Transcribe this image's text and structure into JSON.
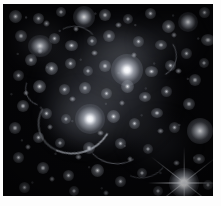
{
  "image": {
    "kind": "astronomical-photograph",
    "subject": "galaxy cluster with gravitational lensing arcs",
    "palette": "grayscale",
    "background_color": "#050507",
    "frame_color": "#fdfdfd",
    "star_color": "#ffffff",
    "halo_color": "#8d93a0",
    "arc_color": "#c9ced8",
    "width_px": 221,
    "height_px": 206,
    "frame": {
      "top_px": 4,
      "left_px": 3,
      "right_px": 8,
      "bottom_px": 10
    },
    "field": {
      "x": 3,
      "y": 4,
      "width": 210,
      "height": 192
    }
  },
  "objects": {
    "intracluster_light": [
      {
        "name": "central-halo",
        "x": 104,
        "y": 92,
        "w": 130,
        "h": 120,
        "opacity": 0.3
      },
      {
        "name": "north-halo",
        "x": 120,
        "y": 52,
        "w": 78,
        "h": 66,
        "opacity": 0.26
      },
      {
        "name": "southwest-halo",
        "x": 78,
        "y": 118,
        "w": 70,
        "h": 58,
        "opacity": 0.24
      },
      {
        "name": "west-halo",
        "x": 42,
        "y": 42,
        "w": 62,
        "h": 52,
        "opacity": 0.18
      },
      {
        "name": "east-halo",
        "x": 168,
        "y": 40,
        "w": 60,
        "h": 50,
        "opacity": 0.14
      }
    ],
    "bright_galaxies": [
      {
        "name": "brightest-cluster-galaxy",
        "x": 126,
        "y": 70,
        "r": 7.5,
        "peak": 1.0
      },
      {
        "name": "second-dominant-galaxy",
        "x": 88,
        "y": 118,
        "r": 6.5,
        "peak": 0.98
      },
      {
        "name": "foreground-star",
        "x": 182,
        "y": 184,
        "r": 7.0,
        "peak": 1.0
      },
      {
        "name": "east-elliptical",
        "x": 200,
        "y": 134,
        "r": 6.0,
        "peak": 0.86
      },
      {
        "name": "north-elliptical",
        "x": 82,
        "y": 14,
        "r": 5.0,
        "peak": 0.88
      },
      {
        "name": "northwest-elliptical",
        "x": 37,
        "y": 44,
        "r": 5.0,
        "peak": 0.82
      },
      {
        "name": "northeast-elliptical",
        "x": 190,
        "y": 22,
        "r": 4.5,
        "peak": 0.8
      }
    ],
    "galaxy_count_visible": 120,
    "lensing_arcs": [
      {
        "name": "giant-tangential-arc",
        "x": 70,
        "y": 128,
        "len": 46,
        "angle": 18
      },
      {
        "name": "southern-arc",
        "x": 110,
        "y": 146,
        "len": 30,
        "angle": -8
      },
      {
        "name": "northeast-arc",
        "x": 150,
        "y": 58,
        "len": 24,
        "angle": 52
      },
      {
        "name": "western-arclet",
        "x": 50,
        "y": 96,
        "len": 18,
        "angle": 66
      }
    ],
    "diffraction_spikes": {
      "name": "star-diffraction-spikes",
      "count": 4,
      "center_x": 182,
      "center_y": 184
    }
  }
}
